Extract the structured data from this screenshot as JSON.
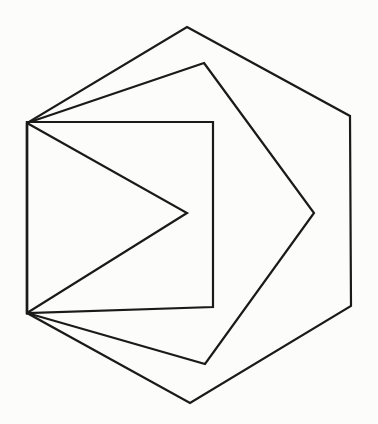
{
  "figure": {
    "canvas": {
      "width": 378,
      "height": 424
    },
    "colors": {
      "line": "#1a1a1a",
      "background": "#fcfcfa"
    },
    "stroke_width": 2.2,
    "shapes": {
      "hexagon": {
        "sides": 6,
        "points": "187,27 350,116 351,306 190,403 27,313 27,123"
      },
      "pentagon": {
        "sides": 5,
        "points": "204,63 314,213 205,364 27,313 27,123"
      },
      "square": {
        "sides": 4,
        "points": "27,122 213,122 213,307 27,313"
      },
      "triangle": {
        "sides": 3,
        "points": "27,123 187,213 27,313"
      }
    },
    "shared_edge": {
      "from": "27,123",
      "to": "27,313"
    }
  }
}
